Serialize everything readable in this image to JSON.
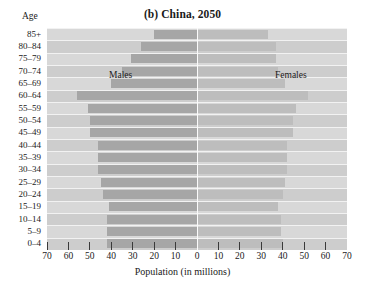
{
  "chart_data": {
    "type": "bar",
    "subtype": "population-pyramid",
    "title": "(b) China, 2050",
    "xlabel": "Population (in millions)",
    "ylabel": "Age",
    "xlim": [
      -70,
      70
    ],
    "xticks": [
      70,
      60,
      50,
      40,
      30,
      20,
      10,
      0,
      10,
      20,
      30,
      40,
      50,
      60,
      70
    ],
    "grid": false,
    "legend_position": "inside-top",
    "categories": [
      "85+",
      "80–84",
      "75–79",
      "70–74",
      "65–69",
      "60–64",
      "55–59",
      "50–54",
      "45–49",
      "40–44",
      "35–39",
      "30–34",
      "25–29",
      "20–24",
      "15–19",
      "10–14",
      "5–9",
      "0–4"
    ],
    "series": [
      {
        "name": "Males",
        "side": "left",
        "color": "#a6a6a6",
        "values": [
          20,
          26,
          31,
          35,
          40,
          56,
          51,
          50,
          50,
          46,
          46,
          46,
          45,
          44,
          41,
          42,
          42,
          42
        ]
      },
      {
        "name": "Females",
        "side": "right",
        "color": "#bdbdbd",
        "values": [
          33,
          37,
          37,
          38,
          41,
          52,
          46,
          45,
          45,
          42,
          42,
          42,
          41,
          40,
          38,
          39,
          39,
          40
        ]
      }
    ],
    "annotations": [
      {
        "text": "Males",
        "position": "left-upper"
      },
      {
        "text": "Females",
        "position": "right-upper"
      }
    ],
    "colors": {
      "plot_background": "#d2d2d2",
      "band_light": "#d8d8d8",
      "band_dark": "#cdcdcd",
      "male_bar": "#a6a6a6",
      "female_bar": "#bdbdbd",
      "center_line": "#fbfbfb",
      "text": "#1a1a1a"
    }
  }
}
